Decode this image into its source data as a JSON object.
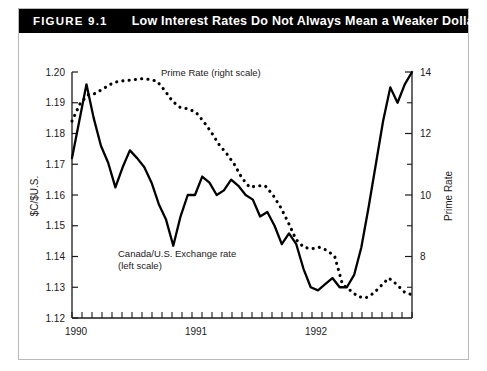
{
  "figure": {
    "number_label": "FIGURE 9.1",
    "title": "Low Interest Rates Do Not Always Mean a Weaker Dollar",
    "header_bg": "#000000",
    "header_fg": "#ffffff",
    "border_color": "#b9b9b9"
  },
  "chart_data": {
    "type": "line",
    "title": "Low Interest Rates Do Not Always Mean a Weaker Dollar",
    "xlabel": "",
    "ylabel": "$C/$U.S.",
    "y2label": "Prime Rate",
    "ylim": [
      1.12,
      1.2
    ],
    "y2lim": [
      6.0,
      14.0
    ],
    "xlim": [
      "1990-01",
      "1992-11"
    ],
    "grid": false,
    "legend": "annotations-inline",
    "yticks": [
      "1.12",
      "1.13",
      "1.14",
      "1.15",
      "1.16",
      "1.17",
      "1.18",
      "1.19",
      "1.20"
    ],
    "ytick_values": [
      1.12,
      1.13,
      1.14,
      1.15,
      1.16,
      1.17,
      1.18,
      1.19,
      1.2
    ],
    "y2ticks": [
      "8",
      "10",
      "12",
      "14"
    ],
    "y2tick_values": [
      8,
      10,
      12,
      14
    ],
    "y2_minor_values": [
      7,
      9,
      11,
      13
    ],
    "xticks": [
      "1990",
      "1991",
      "1992"
    ],
    "xtick_positions": [
      0,
      12,
      24
    ],
    "x_minor_count": 35,
    "annotations": [
      {
        "name": "prime-rate-annotation",
        "text": "Prime Rate (right scale)",
        "x": 161,
        "y": 76
      },
      {
        "name": "exchange-rate-annotation-line1",
        "text": "Canada/U.S. Exchange rate",
        "x": 118,
        "y": 257
      },
      {
        "name": "exchange-rate-annotation-line2",
        "text": "(left scale)",
        "x": 118,
        "y": 269
      }
    ],
    "series": [
      {
        "name": "Canada/U.S. Exchange rate (left scale)",
        "axis": "left",
        "style": "solid",
        "color": "#000000",
        "x": [
          0,
          1,
          2,
          3,
          4,
          5,
          6,
          7,
          8,
          9,
          10,
          11,
          12,
          13,
          14,
          15,
          16,
          17,
          18,
          19,
          20,
          21,
          22,
          23,
          24,
          25,
          26,
          27,
          28,
          29,
          30,
          31,
          32,
          33,
          34
        ],
        "values": [
          1.172,
          1.184,
          1.196,
          1.185,
          1.176,
          1.1705,
          1.1625,
          1.169,
          1.1745,
          1.172,
          1.169,
          1.164,
          1.157,
          1.152,
          1.1435,
          1.153,
          1.16,
          1.16,
          1.166,
          1.164,
          1.16,
          1.1615,
          1.165,
          1.163,
          1.16,
          1.1585,
          1.153,
          1.1545,
          1.15,
          1.144,
          1.1475,
          1.144,
          1.136,
          1.13,
          1.129
        ]
      },
      {
        "name": "Prime Rate (right scale)",
        "axis": "right",
        "style": "dotted",
        "color": "#000000",
        "x": [
          0,
          1,
          2,
          3,
          4,
          5,
          6,
          7,
          8,
          9,
          10,
          11,
          12,
          13,
          14,
          15,
          16,
          17,
          18,
          19,
          20,
          21,
          22,
          23,
          24,
          25,
          26,
          27,
          28,
          29,
          30,
          31,
          32,
          33,
          34
        ],
        "values": [
          12.4,
          12.95,
          13.25,
          13.3,
          13.45,
          13.6,
          13.7,
          13.72,
          13.75,
          13.78,
          13.76,
          13.7,
          13.4,
          13.05,
          12.85,
          12.8,
          12.7,
          12.4,
          12.05,
          11.65,
          11.35,
          11.0,
          10.55,
          10.25,
          10.3,
          10.3,
          10.0,
          9.6,
          9.1,
          8.55,
          8.3,
          8.25,
          8.3,
          8.2,
          8.0
        ]
      }
    ],
    "series_second_half_note": "values continue below in series_tail",
    "series_tail": {
      "exchange_rate": [
        1.129,
        1.131,
        1.133,
        1.13,
        1.13,
        1.134,
        1.143,
        1.156,
        1.17,
        1.184,
        1.195,
        1.19,
        1.196,
        1.2
      ],
      "prime_rate": [
        7.4,
        7.1,
        6.9,
        6.7,
        6.65,
        6.8,
        7.05,
        7.3,
        7.1,
        6.85,
        6.75
      ]
    }
  }
}
